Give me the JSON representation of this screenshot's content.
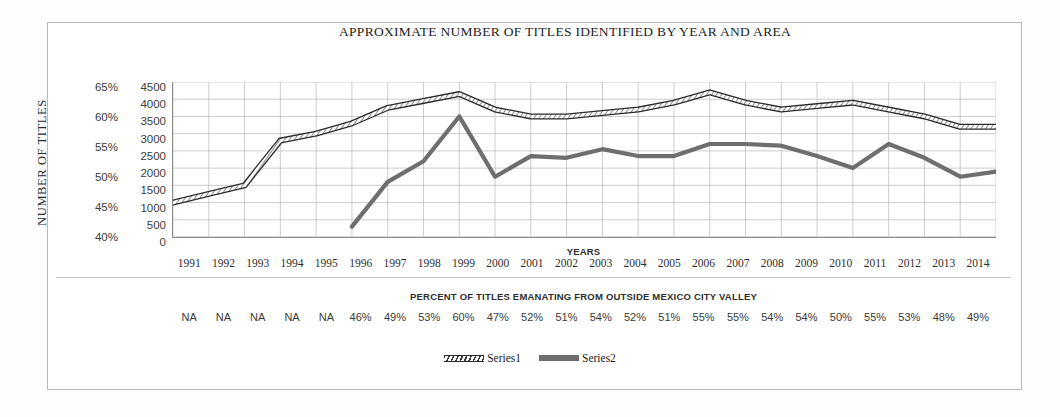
{
  "chart_data": {
    "type": "line",
    "title": "APPROXIMATE NUMBER OF TITLES IDENTIFIED BY YEAR AND AREA",
    "xlabel": "YEARS",
    "ylabel": "NUMBER OF TITLES",
    "secondary_band_title": "PERCENT OF TITLES EMANATING FROM OUTSIDE MEXICO CITY VALLEY",
    "grid": true,
    "legend_position": "bottom",
    "categories": [
      "1991",
      "1992",
      "1993",
      "1994",
      "1995",
      "1996",
      "1997",
      "1998",
      "1999",
      "2000",
      "2001",
      "2002",
      "2003",
      "2004",
      "2005",
      "2006",
      "2007",
      "2008",
      "2009",
      "2010",
      "2011",
      "2012",
      "2013",
      "2014"
    ],
    "left_axis": {
      "label": "NUMBER OF TITLES",
      "ticks": [
        "65%",
        "60%",
        "55%",
        "50%",
        "45%",
        "40%"
      ],
      "ylim": [
        40,
        65
      ],
      "step": 5,
      "unit": "%"
    },
    "right_axis": {
      "ticks": [
        "4500",
        "4000",
        "3500",
        "3000",
        "2500",
        "2000",
        "1500",
        "1000",
        "500",
        "0"
      ],
      "ylim": [
        0,
        4500
      ],
      "step": 500
    },
    "series": [
      {
        "name": "Series1",
        "style": "hatched-band",
        "color": "#2a2a2a",
        "values": [
          1000,
          1250,
          1500,
          2800,
          3000,
          3300,
          3750,
          3950,
          4150,
          3700,
          3500,
          3500,
          3600,
          3700,
          3900,
          4200,
          3900,
          3700,
          3800,
          3900,
          3700,
          3500,
          3200,
          3200
        ]
      },
      {
        "name": "Series2",
        "style": "solid-thick",
        "color": "#6e6e6e",
        "values": [
          null,
          null,
          null,
          null,
          null,
          300,
          1600,
          2200,
          3500,
          1750,
          2350,
          2300,
          2550,
          2350,
          2350,
          2700,
          2700,
          2650,
          2350,
          2000,
          2700,
          2300,
          1750,
          1900
        ]
      }
    ],
    "percent_row": {
      "values": [
        "NA",
        "NA",
        "NA",
        "NA",
        "NA",
        "46%",
        "49%",
        "53%",
        "60%",
        "47%",
        "52%",
        "51%",
        "54%",
        "52%",
        "51%",
        "55%",
        "55%",
        "54%",
        "54%",
        "50%",
        "55%",
        "53%",
        "48%",
        "49%"
      ]
    },
    "legend": [
      {
        "label": "Series1"
      },
      {
        "label": "Series2"
      }
    ]
  }
}
